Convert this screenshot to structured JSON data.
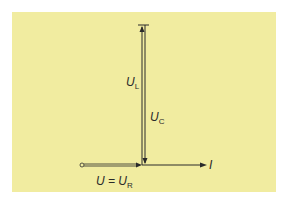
{
  "diagram": {
    "background_color": "#f1eca0",
    "line_color": "#2a2a2a",
    "labels": {
      "UL": {
        "main": "U",
        "sub": "L"
      },
      "UC": {
        "main": "U",
        "sub": "C"
      },
      "U_eq": {
        "main": "U = U",
        "sub": "R"
      },
      "I": {
        "main": "I"
      }
    }
  }
}
